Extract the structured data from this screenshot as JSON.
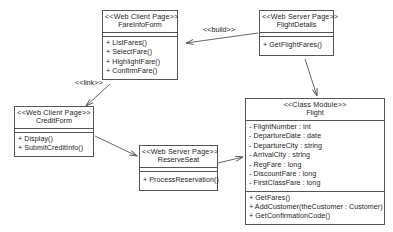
{
  "diagram": {
    "background": "#ffffff",
    "line_color": "#555555",
    "text_color": "#1c1c1c"
  },
  "classes": {
    "fare_info_form": {
      "stereotype": "<<Web Client Page>>",
      "name": "FareInfoForm",
      "attributes": [],
      "operations": [
        "+ ListFares()",
        "+ SelectFare()",
        "+ HighlightFare()",
        "+ ConfirmFare()"
      ]
    },
    "flight_details": {
      "stereotype": "<<Web Server Page>>",
      "name": "FlightDetails",
      "attributes": [],
      "operations": [
        "+ GetFlightFares()"
      ]
    },
    "credit_form": {
      "stereotype": "<<Web Client Page>>",
      "name": "CreditForm",
      "attributes": [],
      "operations": [
        "+ Display()",
        "+ SubmitCreditInfo()"
      ]
    },
    "reserve_seat": {
      "stereotype": "<<Web Server Page>>",
      "name": "ReserveSeat",
      "attributes": [],
      "operations": [
        "+ ProcessReservation()"
      ]
    },
    "flight": {
      "stereotype": "<<Class Module>>",
      "name": "Flight",
      "attributes": [
        "- FlightNumber : int",
        "- DepartureDate : date",
        "- DepartureCity : string",
        "- ArrivalCity : string",
        "- RegFare : long",
        "- DiscountFare : long",
        "- FirstClassFare : long"
      ],
      "operations": [
        "+ GetFares()",
        "+ AddCustomer(theCustomer : Customer)",
        "+ GetConfirmationCode()"
      ]
    }
  },
  "relationships": {
    "build": {
      "label": "<<build>>",
      "from": "flight_details",
      "to": "fare_info_form"
    },
    "link": {
      "label": "<<link>>",
      "from": "fare_info_form",
      "to": "credit_form"
    },
    "details_to_flight": {
      "label": "",
      "from": "flight_details",
      "to": "flight"
    },
    "credit_to_reserve": {
      "label": "",
      "from": "credit_form",
      "to": "reserve_seat"
    },
    "reserve_to_flight": {
      "label": "",
      "from": "reserve_seat",
      "to": "flight"
    }
  }
}
